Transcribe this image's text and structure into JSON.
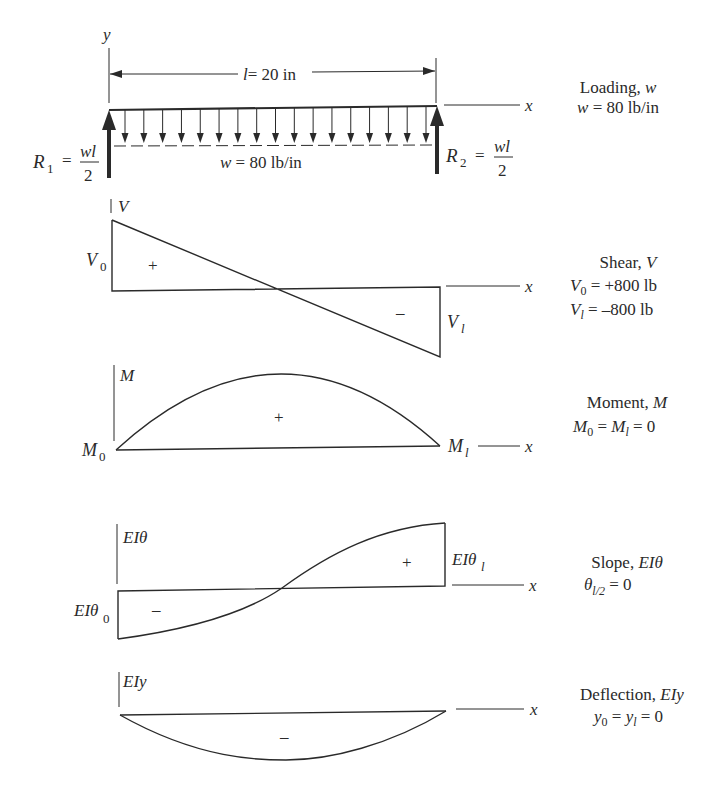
{
  "loading": {
    "axis_y_label": "y",
    "axis_x_label": "x",
    "span_label": "l = 20 in",
    "span_var": "l",
    "span_value": "= 20 in",
    "load_label": "w = 80 lb/in",
    "r1": {
      "symbol": "R",
      "sub": "1",
      "eq": "=",
      "num": "wl",
      "den": "2"
    },
    "r2": {
      "symbol": "R",
      "sub": "2",
      "eq": "=",
      "num": "wl",
      "den": "2"
    },
    "caption_title": "Loading, ",
    "caption_title_var": "w",
    "caption_line2": "w = 80 lb/in",
    "arrow_count": 17
  },
  "shear": {
    "axis_label": "V",
    "axis_x_label": "x",
    "left_label": "V",
    "left_sub": "0",
    "right_label": "V",
    "right_sub": "l",
    "pos_sign": "+",
    "neg_sign": "–",
    "caption_title": "Shear, ",
    "caption_title_var": "V",
    "caption_line2_var": "V",
    "caption_line2_sub": "0",
    "caption_line2_val": " = +800 lb",
    "caption_line3_var": "V",
    "caption_line3_sub": "l",
    "caption_line3_val": " = –800 lb"
  },
  "moment": {
    "axis_label": "M",
    "axis_x_label": "x",
    "left_label": "M",
    "left_sub": "0",
    "right_label": "M",
    "right_sub": "l",
    "pos_sign": "+",
    "caption_title": "Moment, ",
    "caption_title_var": "M",
    "caption_line2": "M₀ = Mₗ = 0",
    "caption_line2_a": "M",
    "caption_line2_a_sub": "0",
    "caption_line2_b": "M",
    "caption_line2_b_sub": "l",
    "caption_line2_val": " = 0"
  },
  "slope": {
    "axis_label": "EIθ",
    "axis_x_label": "x",
    "left_label": "EIθ",
    "left_sub": "0",
    "right_label": "EIθ",
    "right_sub": "l",
    "pos_sign": "+",
    "neg_sign": "–",
    "caption_title": "Slope, ",
    "caption_title_var": "EIθ",
    "caption_line2_var": "θ",
    "caption_line2_sub": "l/2",
    "caption_line2_val": " = 0"
  },
  "deflection": {
    "axis_label": "EIy",
    "axis_x_label": "x",
    "neg_sign": "–",
    "caption_title": "Deflection, ",
    "caption_title_var": "EIy",
    "caption_line2_a": "y",
    "caption_line2_a_sub": "0",
    "caption_line2_b": "y",
    "caption_line2_b_sub": "l",
    "caption_line2_val": " = 0"
  },
  "colors": {
    "ink": "#2a2a2a",
    "background": "#ffffff"
  }
}
